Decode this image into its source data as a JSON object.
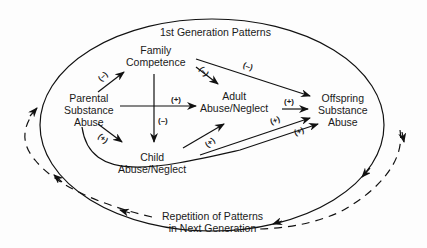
{
  "diagram": {
    "title": "1st Generation Patterns",
    "footer_line1": "Repetition of Patterns",
    "footer_line2": "in Next Generation",
    "nodes": {
      "family": [
        "Family",
        "Competence"
      ],
      "parental": [
        "Parental",
        "Substance",
        "Abuse"
      ],
      "adult": [
        "Adult",
        "Abuse/Neglect"
      ],
      "child": [
        "Child",
        "Abuse/Neglect"
      ],
      "offspring": [
        "Offspring",
        "Substance",
        "Abuse"
      ]
    },
    "edges": [
      {
        "from": "Parental Substance Abuse",
        "to": "Family Competence",
        "sign": "(–)"
      },
      {
        "from": "Family Competence",
        "to": "Adult Abuse/Neglect",
        "sign": "(–)"
      },
      {
        "from": "Family Competence",
        "to": "Offspring Substance Abuse",
        "sign": "(–)"
      },
      {
        "from": "Family Competence",
        "to": "Child Abuse/Neglect",
        "sign": "(–)"
      },
      {
        "from": "Parental Substance Abuse",
        "to": "Adult Abuse/Neglect",
        "sign": "(+)"
      },
      {
        "from": "Parental Substance Abuse",
        "to": "Child Abuse/Neglect",
        "sign": "(+)"
      },
      {
        "from": "Child Abuse/Neglect",
        "to": "Adult Abuse/Neglect",
        "sign": "(+)"
      },
      {
        "from": "Adult Abuse/Neglect",
        "to": "Offspring Substance Abuse",
        "sign": "(+)"
      },
      {
        "from": "Child Abuse/Neglect",
        "to": "Offspring Substance Abuse",
        "sign": "(+)"
      },
      {
        "from": "Parental Substance Abuse",
        "to": "Offspring Substance Abuse",
        "sign": "(+)"
      }
    ],
    "signs": {
      "p_to_f": "(–)",
      "f_to_a": "(–)",
      "f_to_o": "(–)",
      "f_to_c": "(–)",
      "p_to_a": "(+)",
      "p_to_c": "(+)",
      "c_to_a": "(+)",
      "a_to_o": "(+)",
      "c_to_o": "(+)",
      "p_to_o": "(+)"
    }
  }
}
